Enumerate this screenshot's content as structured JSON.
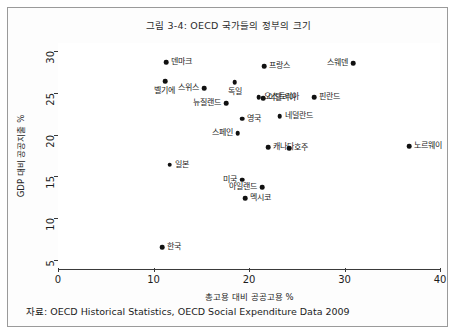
{
  "figure": {
    "title": "그림 3-4: OECD 국가들의 정부의 크기",
    "source_note": "자료: OECD Historical Statistics, OECD Social Expenditure Data 2009"
  },
  "chart_data": {
    "type": "scatter",
    "title": "그림 3-4: OECD 국가들의 정부의 크기",
    "xlabel": "총고용 대비 공공고용 %",
    "ylabel": "GDP 대비 공공지출 %",
    "xlim": [
      0,
      40
    ],
    "ylim": [
      4,
      31
    ],
    "xticks": [
      "0",
      "10",
      "20",
      "30",
      "40"
    ],
    "xtick_values": [
      0,
      10,
      20,
      30,
      40
    ],
    "yticks": [
      "5",
      "10",
      "15",
      "20",
      "25",
      "30"
    ],
    "ytick_values": [
      5,
      10,
      15,
      20,
      25,
      30
    ],
    "grid": false,
    "legend": "none",
    "marker_color": "#111111",
    "points": [
      {
        "label": "덴마크",
        "x": 11.3,
        "y": 28.7,
        "label_pos": "right"
      },
      {
        "label": "프랑스",
        "x": 21.6,
        "y": 28.2,
        "label_pos": "right"
      },
      {
        "label": "스웨덴",
        "x": 30.9,
        "y": 28.6,
        "label_pos": "left"
      },
      {
        "label": "벨기에",
        "x": 11.2,
        "y": 26.4,
        "label_pos": "below"
      },
      {
        "label": "스위스",
        "x": 15.3,
        "y": 25.6,
        "label_pos": "left"
      },
      {
        "label": "독일",
        "x": 18.5,
        "y": 26.3,
        "label_pos": "below"
      },
      {
        "label": "오스트리아",
        "x": 21.0,
        "y": 24.5,
        "label_pos": "right"
      },
      {
        "label": "이탈리아",
        "x": 21.5,
        "y": 24.4,
        "label_pos": "right"
      },
      {
        "label": "핀란드",
        "x": 26.8,
        "y": 24.5,
        "label_pos": "right"
      },
      {
        "label": "뉴질랜드",
        "x": 17.6,
        "y": 23.8,
        "label_pos": "left"
      },
      {
        "label": "영국",
        "x": 19.3,
        "y": 21.9,
        "label_pos": "right"
      },
      {
        "label": "네덜란드",
        "x": 23.2,
        "y": 22.2,
        "label_pos": "right"
      },
      {
        "label": "스페인",
        "x": 18.8,
        "y": 20.2,
        "label_pos": "left"
      },
      {
        "label": "캐나다",
        "x": 22.0,
        "y": 18.5,
        "label_pos": "right"
      },
      {
        "label": "호주",
        "x": 24.2,
        "y": 18.4,
        "label_pos": "right"
      },
      {
        "label": "노르웨이",
        "x": 36.8,
        "y": 18.6,
        "label_pos": "right"
      },
      {
        "label": "일본",
        "x": 11.7,
        "y": 16.4,
        "label_pos": "right"
      },
      {
        "label": "미국",
        "x": 19.3,
        "y": 14.6,
        "label_pos": "left"
      },
      {
        "label": "아일랜드",
        "x": 21.4,
        "y": 13.7,
        "label_pos": "left"
      },
      {
        "label": "멕시코",
        "x": 19.6,
        "y": 12.4,
        "label_pos": "right"
      },
      {
        "label": "한국",
        "x": 10.9,
        "y": 6.5,
        "label_pos": "right"
      }
    ]
  }
}
